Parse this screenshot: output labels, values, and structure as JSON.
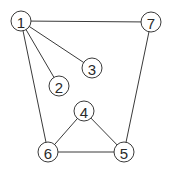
{
  "graph": {
    "title": "",
    "node_radius": 10,
    "nodes": [
      {
        "id": "1",
        "label": "1",
        "x": 21,
        "y": 21
      },
      {
        "id": "2",
        "label": "2",
        "x": 59,
        "y": 86
      },
      {
        "id": "3",
        "label": "3",
        "x": 92,
        "y": 68
      },
      {
        "id": "4",
        "label": "4",
        "x": 84,
        "y": 111
      },
      {
        "id": "5",
        "label": "5",
        "x": 124,
        "y": 152
      },
      {
        "id": "6",
        "label": "6",
        "x": 48,
        "y": 152
      },
      {
        "id": "7",
        "label": "7",
        "x": 151,
        "y": 22
      }
    ],
    "edges": [
      {
        "from": "1",
        "to": "7"
      },
      {
        "from": "1",
        "to": "3"
      },
      {
        "from": "1",
        "to": "2"
      },
      {
        "from": "1",
        "to": "6"
      },
      {
        "from": "7",
        "to": "5"
      },
      {
        "from": "4",
        "to": "6"
      },
      {
        "from": "4",
        "to": "5"
      },
      {
        "from": "6",
        "to": "5"
      }
    ],
    "colors": {
      "stroke": "#3a3a3a",
      "fill": "#ffffff",
      "text": "#2a2a2a"
    }
  }
}
